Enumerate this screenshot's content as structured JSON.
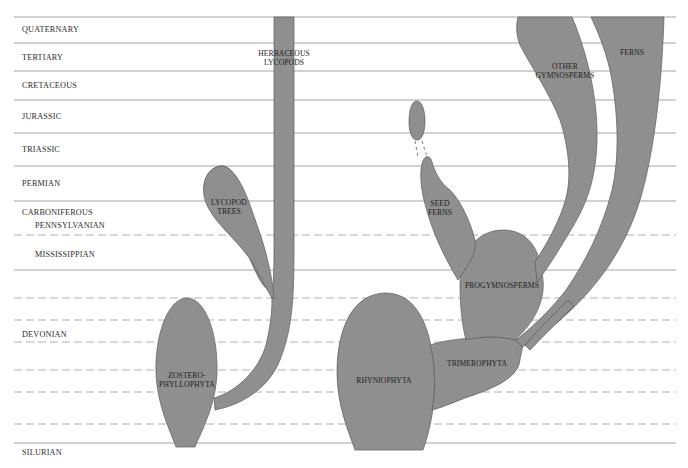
{
  "diagram": {
    "type": "phylogenetic-timeline",
    "fill_color": "#8f8f8f",
    "periods": [
      {
        "label": "QUATERNARY",
        "x": 22,
        "y": 25
      },
      {
        "label": "TERTIARY",
        "x": 22,
        "y": 53
      },
      {
        "label": "CRETACEOUS",
        "x": 22,
        "y": 81
      },
      {
        "label": "JURASSIC",
        "x": 22,
        "y": 112
      },
      {
        "label": "TRIASSIC",
        "x": 22,
        "y": 145
      },
      {
        "label": "PERMIAN",
        "x": 22,
        "y": 179
      },
      {
        "label": "CARBONIFEROUS",
        "x": 22,
        "y": 208
      },
      {
        "label": "PENNSYLVANIAN",
        "x": 35,
        "y": 221
      },
      {
        "label": "MISSISSIPPIAN",
        "x": 35,
        "y": 250
      },
      {
        "label": "DEVONIAN",
        "x": 22,
        "y": 330
      },
      {
        "label": "SILURIAN",
        "x": 22,
        "y": 448
      }
    ],
    "taxa": [
      {
        "label": "HERBACEOUS\nLYCOPODS",
        "line1": "HERBACEOUS",
        "line2": "LYCOPODS",
        "x": 284,
        "y": 50
      },
      {
        "label": "LYCOPOD\nTREES",
        "line1": "LYCOPOD",
        "line2": "TREES",
        "x": 230,
        "y": 198
      },
      {
        "label": "ZOSTERO-\nPHYLLOPHYTA",
        "line1": "ZOSTERO-",
        "line2": "PHYLLOPHYTA",
        "x": 187,
        "y": 375
      },
      {
        "label": "SEED\nFERNS",
        "line1": "SEED",
        "line2": "FERNS",
        "x": 442,
        "y": 200
      },
      {
        "label": "OTHER\nGYMNOSPERMS",
        "line1": "OTHER",
        "line2": "GYMNOSPERMS",
        "x": 563,
        "y": 66
      },
      {
        "label": "FERNS",
        "line1": "FERNS",
        "line2": "",
        "x": 632,
        "y": 52
      },
      {
        "label": "PROGYMNOSPERMS",
        "line1": "PROGYMNOSPERMS",
        "line2": "",
        "x": 502,
        "y": 285
      },
      {
        "label": "TRIMEROPHYTA",
        "line1": "TRIMEROPHYTA",
        "line2": "",
        "x": 477,
        "y": 363
      },
      {
        "label": "RHYNIOPHYTA",
        "line1": "RHYNIOPHYTA",
        "line2": "",
        "x": 383,
        "y": 381
      }
    ],
    "lines": [
      {
        "y": 17,
        "style": "solid"
      },
      {
        "y": 43,
        "style": "solid"
      },
      {
        "y": 71,
        "style": "solid"
      },
      {
        "y": 100,
        "style": "solid"
      },
      {
        "y": 133,
        "style": "solid"
      },
      {
        "y": 166,
        "style": "solid"
      },
      {
        "y": 201,
        "style": "solid"
      },
      {
        "y": 235,
        "style": "dashed"
      },
      {
        "y": 270,
        "style": "solid"
      },
      {
        "y": 298,
        "style": "dashed"
      },
      {
        "y": 320,
        "style": "dashed"
      },
      {
        "y": 342,
        "style": "dashed"
      },
      {
        "y": 370,
        "style": "dashed"
      },
      {
        "y": 392,
        "style": "dashed"
      },
      {
        "y": 424,
        "style": "dashed"
      },
      {
        "y": 443,
        "style": "solid"
      }
    ]
  }
}
